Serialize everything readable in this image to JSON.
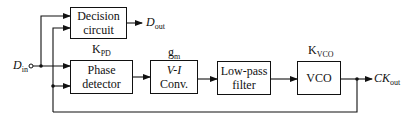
{
  "diagram": {
    "type": "block-diagram",
    "blocks": [
      {
        "id": "decision",
        "line1": "Decision",
        "line2": "circuit"
      },
      {
        "id": "pd",
        "line1": "Phase",
        "line2": "detector",
        "gain_main": "K",
        "gain_sub": "PD"
      },
      {
        "id": "vi",
        "line1": "V-I",
        "line2": "Conv.",
        "gain_main": "g",
        "gain_sub": "m"
      },
      {
        "id": "lpf",
        "line1": "Low-pass",
        "line2": "filter"
      },
      {
        "id": "vco",
        "line1": "VCO",
        "gain_main": "K",
        "gain_sub": "VCO"
      }
    ],
    "signals": {
      "input": {
        "main": "D",
        "sub": "in"
      },
      "data_out": {
        "main": "D",
        "sub": "out"
      },
      "clock_out": {
        "main": "CK",
        "sub": "out"
      }
    }
  }
}
